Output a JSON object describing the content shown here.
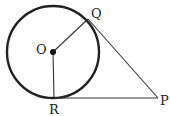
{
  "diagram": {
    "type": "circle-tangent-geometry",
    "circle": {
      "center_label": "O",
      "cx": 53,
      "cy": 52,
      "r": 46
    },
    "points": {
      "O": {
        "label": "O",
        "x": 53,
        "y": 52
      },
      "Q": {
        "label": "Q",
        "x": 88,
        "y": 19
      },
      "R": {
        "label": "R",
        "x": 54,
        "y": 98
      },
      "P": {
        "label": "P",
        "x": 158,
        "y": 98
      }
    },
    "segments": [
      {
        "name": "OQ",
        "from": "O",
        "to": "Q"
      },
      {
        "name": "OR",
        "from": "O",
        "to": "R"
      },
      {
        "name": "QP",
        "from": "Q",
        "to": "P"
      },
      {
        "name": "RP",
        "from": "R",
        "to": "P"
      }
    ],
    "stroke_color": "#222222"
  }
}
